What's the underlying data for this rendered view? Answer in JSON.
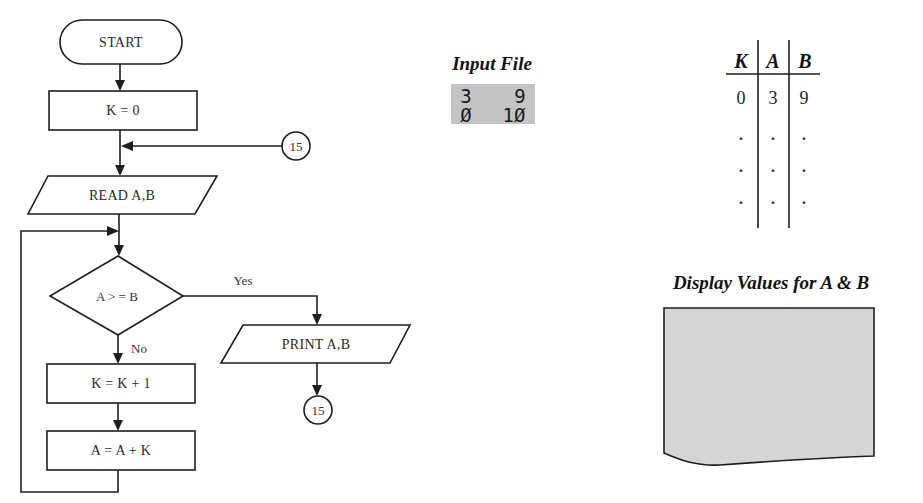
{
  "flowchart": {
    "start": "START",
    "init": "K = 0",
    "connector_in": "15",
    "read": "READ A,B",
    "decision": "A > = B",
    "yes_label": "Yes",
    "no_label": "No",
    "increment_k": "K = K + 1",
    "update_a": "A = A + K",
    "print": "PRINT A,B",
    "connector_out": "15"
  },
  "input_file": {
    "title": "Input File",
    "rows": [
      [
        "3",
        "9"
      ],
      [
        "Ø",
        "1Ø"
      ]
    ],
    "fill_color": "#c4c4c4"
  },
  "trace_table": {
    "headers": [
      "K",
      "A",
      "B"
    ],
    "rows": [
      [
        "0",
        "3",
        "9"
      ],
      [
        ".",
        ".",
        "."
      ],
      [
        ".",
        ".",
        "."
      ],
      [
        ".",
        ".",
        "."
      ]
    ]
  },
  "display": {
    "title": "Display Values for A & B",
    "fill_color": "#d6d6d6"
  }
}
